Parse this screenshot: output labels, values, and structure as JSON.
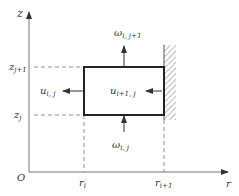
{
  "diagram": {
    "axes": {
      "vertical_label": "z",
      "horizontal_label": "r",
      "origin_label": "O"
    },
    "z_ticks": [
      {
        "base": "z",
        "sub": "j+1"
      },
      {
        "base": "z",
        "sub": "j"
      }
    ],
    "r_ticks": [
      {
        "base": "r",
        "sub": "i"
      },
      {
        "base": "r",
        "sub": "i+1"
      }
    ],
    "vectors": {
      "omega_top": {
        "base": "ω",
        "sub": "i, j+1"
      },
      "omega_bottom": {
        "base": "ω",
        "sub": "i, j"
      },
      "u_left": {
        "base": "u",
        "sub": "i, j"
      },
      "u_right": {
        "base": "u",
        "sub": "i+1, j"
      }
    },
    "colors": {
      "line": "#333333",
      "axis": "#777777",
      "dashed": "#777777"
    }
  }
}
